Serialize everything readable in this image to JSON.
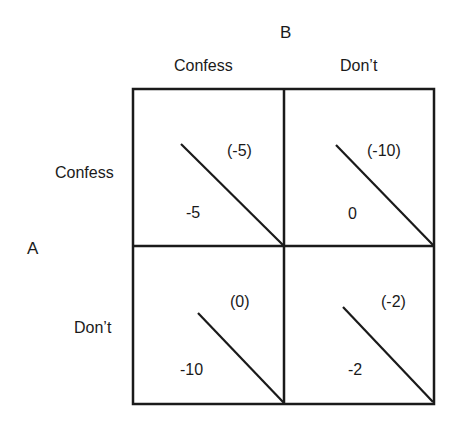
{
  "diagram": {
    "type": "payoff-matrix",
    "column_player": "B",
    "row_player": "A",
    "column_strategies": [
      "Confess",
      "Don’t"
    ],
    "row_strategies": [
      "Confess",
      "Don’t"
    ],
    "cells": [
      {
        "row": "Confess",
        "col": "Confess",
        "payoff_A": "-5",
        "payoff_B": "(-5)"
      },
      {
        "row": "Confess",
        "col": "Don’t",
        "payoff_A": "0",
        "payoff_B": "(-10)"
      },
      {
        "row": "Don’t",
        "col": "Confess",
        "payoff_A": "-10",
        "payoff_B": "(0)"
      },
      {
        "row": "Don’t",
        "col": "Don’t",
        "payoff_A": "-2",
        "payoff_B": "(-2)"
      }
    ],
    "line_color": "#1a1a1a"
  }
}
